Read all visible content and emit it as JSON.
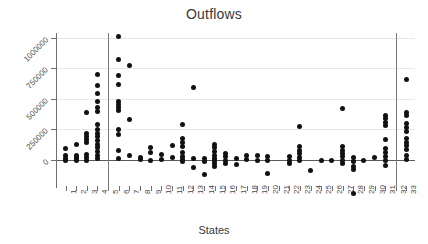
{
  "chart_data": {
    "type": "scatter",
    "title": "Outflows",
    "xlabel": "States",
    "ylabel": "",
    "grid": true,
    "legend": false,
    "xlim": [
      0.2,
      33.8
    ],
    "ylim": [
      -330000,
      1130000
    ],
    "y_ticks": [
      0,
      250000,
      500000,
      750000,
      1000000
    ],
    "y_tick_labels": [
      "0",
      "250000",
      "500000",
      "750000",
      "1000000"
    ],
    "x_ticks": [
      1,
      2,
      3,
      4,
      5,
      6,
      7,
      8,
      9,
      10,
      11,
      12,
      13,
      14,
      15,
      16,
      17,
      18,
      19,
      20,
      21,
      22,
      23,
      24,
      25,
      26,
      27,
      28,
      29,
      30,
      31,
      32,
      33
    ],
    "x_tick_labels": [
      "1",
      "2",
      "3",
      "4",
      "5",
      "6",
      "7",
      "8",
      "9",
      "10",
      "11",
      "12",
      "13",
      "14",
      "15",
      "16",
      "17",
      "18",
      "19",
      "20",
      "21",
      "22",
      "23",
      "24",
      "25",
      "26",
      "27",
      "28",
      "29",
      "30",
      "31",
      "32",
      "33"
    ],
    "reference_lines": [
      {
        "orientation": "vertical",
        "x": 5.0
      },
      {
        "orientation": "vertical",
        "x": 32.0
      }
    ],
    "zero_line": 0,
    "marker": "filled-circle",
    "marker_color": "#111111",
    "series": [
      {
        "name": "outflows",
        "points": [
          {
            "x": 1,
            "y": 90000
          },
          {
            "x": 1,
            "y": 40000
          },
          {
            "x": 1,
            "y": 15000
          },
          {
            "x": 1,
            "y": 0
          },
          {
            "x": 2,
            "y": 130000
          },
          {
            "x": 2,
            "y": 40000
          },
          {
            "x": 2,
            "y": 20000
          },
          {
            "x": 2,
            "y": 5000
          },
          {
            "x": 2,
            "y": -5000
          },
          {
            "x": 3,
            "y": 390000
          },
          {
            "x": 3,
            "y": 215000
          },
          {
            "x": 3,
            "y": 190000
          },
          {
            "x": 3,
            "y": 165000
          },
          {
            "x": 3,
            "y": 140000
          },
          {
            "x": 3,
            "y": 45000
          },
          {
            "x": 3,
            "y": 20000
          },
          {
            "x": 3,
            "y": 0
          },
          {
            "x": 4,
            "y": 700000
          },
          {
            "x": 4,
            "y": 610000
          },
          {
            "x": 4,
            "y": 540000
          },
          {
            "x": 4,
            "y": 480000
          },
          {
            "x": 4,
            "y": 430000
          },
          {
            "x": 4,
            "y": 400000
          },
          {
            "x": 4,
            "y": 290000
          },
          {
            "x": 4,
            "y": 250000
          },
          {
            "x": 4,
            "y": 220000
          },
          {
            "x": 4,
            "y": 190000
          },
          {
            "x": 4,
            "y": 160000
          },
          {
            "x": 4,
            "y": 130000
          },
          {
            "x": 4,
            "y": 100000
          },
          {
            "x": 4,
            "y": 70000
          },
          {
            "x": 4,
            "y": 40000
          },
          {
            "x": 4,
            "y": 10000
          },
          {
            "x": 6,
            "y": 1010000
          },
          {
            "x": 6,
            "y": 820000
          },
          {
            "x": 6,
            "y": 690000
          },
          {
            "x": 6,
            "y": 620000
          },
          {
            "x": 6,
            "y": 480000
          },
          {
            "x": 6,
            "y": 455000
          },
          {
            "x": 6,
            "y": 430000
          },
          {
            "x": 6,
            "y": 405000
          },
          {
            "x": 6,
            "y": 250000
          },
          {
            "x": 6,
            "y": 210000
          },
          {
            "x": 6,
            "y": 80000
          },
          {
            "x": 6,
            "y": 10000
          },
          {
            "x": 7,
            "y": 770000
          },
          {
            "x": 7,
            "y": 330000
          },
          {
            "x": 7,
            "y": 40000
          },
          {
            "x": 8,
            "y": 20000
          },
          {
            "x": 8,
            "y": 5000
          },
          {
            "x": 9,
            "y": 105000
          },
          {
            "x": 9,
            "y": 60000
          },
          {
            "x": 9,
            "y": 0
          },
          {
            "x": 10,
            "y": 45000
          },
          {
            "x": 10,
            "y": 5000
          },
          {
            "x": 11,
            "y": 120000
          },
          {
            "x": 11,
            "y": 20000
          },
          {
            "x": 12,
            "y": 290000
          },
          {
            "x": 12,
            "y": 175000
          },
          {
            "x": 12,
            "y": 140000
          },
          {
            "x": 12,
            "y": 110000
          },
          {
            "x": 12,
            "y": 60000
          },
          {
            "x": 12,
            "y": 30000
          },
          {
            "x": 12,
            "y": 5000
          },
          {
            "x": 12,
            "y": -15000
          },
          {
            "x": 13,
            "y": 590000
          },
          {
            "x": 13,
            "y": 10000
          },
          {
            "x": 13,
            "y": -60000
          },
          {
            "x": 14,
            "y": 15000
          },
          {
            "x": 14,
            "y": -10000
          },
          {
            "x": 14,
            "y": -115000
          },
          {
            "x": 15,
            "y": 125000
          },
          {
            "x": 15,
            "y": 100000
          },
          {
            "x": 15,
            "y": 70000
          },
          {
            "x": 15,
            "y": 40000
          },
          {
            "x": 15,
            "y": 15000
          },
          {
            "x": 15,
            "y": -5000
          },
          {
            "x": 15,
            "y": -30000
          },
          {
            "x": 15,
            "y": -55000
          },
          {
            "x": 16,
            "y": 55000
          },
          {
            "x": 16,
            "y": 25000
          },
          {
            "x": 16,
            "y": 0
          },
          {
            "x": 16,
            "y": -30000
          },
          {
            "x": 17,
            "y": 10000
          },
          {
            "x": 17,
            "y": -35000
          },
          {
            "x": 18,
            "y": 40000
          },
          {
            "x": 18,
            "y": 5000
          },
          {
            "x": 19,
            "y": 35000
          },
          {
            "x": 19,
            "y": 0
          },
          {
            "x": 20,
            "y": 30000
          },
          {
            "x": 20,
            "y": 0
          },
          {
            "x": 20,
            "y": -110000
          },
          {
            "x": 22,
            "y": 25000
          },
          {
            "x": 22,
            "y": 0
          },
          {
            "x": 22,
            "y": -30000
          },
          {
            "x": 23,
            "y": 275000
          },
          {
            "x": 23,
            "y": 110000
          },
          {
            "x": 23,
            "y": 80000
          },
          {
            "x": 23,
            "y": 50000
          },
          {
            "x": 23,
            "y": 20000
          },
          {
            "x": 23,
            "y": -5000
          },
          {
            "x": 24,
            "y": -85000
          },
          {
            "x": 25,
            "y": 0
          },
          {
            "x": 26,
            "y": 0
          },
          {
            "x": 27,
            "y": 420000
          },
          {
            "x": 27,
            "y": 110000
          },
          {
            "x": 27,
            "y": 80000
          },
          {
            "x": 27,
            "y": 55000
          },
          {
            "x": 27,
            "y": 25000
          },
          {
            "x": 27,
            "y": 0
          },
          {
            "x": 27,
            "y": -25000
          },
          {
            "x": 28,
            "y": 20000
          },
          {
            "x": 28,
            "y": -10000
          },
          {
            "x": 28,
            "y": -50000
          },
          {
            "x": 28,
            "y": -80000
          },
          {
            "x": 28,
            "y": -270000
          },
          {
            "x": 29,
            "y": 0
          },
          {
            "x": 30,
            "y": 20000
          },
          {
            "x": 31,
            "y": 360000
          },
          {
            "x": 31,
            "y": 335000
          },
          {
            "x": 31,
            "y": 310000
          },
          {
            "x": 31,
            "y": 285000
          },
          {
            "x": 31,
            "y": 170000
          },
          {
            "x": 31,
            "y": 90000
          },
          {
            "x": 31,
            "y": 60000
          },
          {
            "x": 31,
            "y": 30000
          },
          {
            "x": 31,
            "y": 0
          },
          {
            "x": 31,
            "y": -45000
          },
          {
            "x": 33,
            "y": 660000
          },
          {
            "x": 33,
            "y": 390000
          },
          {
            "x": 33,
            "y": 360000
          },
          {
            "x": 33,
            "y": 300000
          },
          {
            "x": 33,
            "y": 265000
          },
          {
            "x": 33,
            "y": 230000
          },
          {
            "x": 33,
            "y": 175000
          },
          {
            "x": 33,
            "y": 145000
          },
          {
            "x": 33,
            "y": 115000
          },
          {
            "x": 33,
            "y": 85000
          },
          {
            "x": 33,
            "y": 40000
          },
          {
            "x": 33,
            "y": 5000
          }
        ]
      }
    ]
  }
}
